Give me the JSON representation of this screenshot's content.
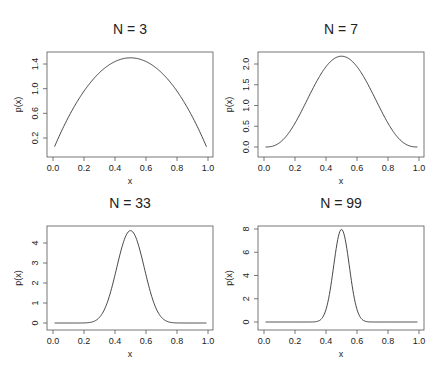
{
  "chart_data": [
    {
      "type": "line",
      "title": "N = 3",
      "xlabel": "x",
      "ylabel": "p(x)",
      "xlim": [
        0.0,
        1.0
      ],
      "ylim": [
        0.06,
        1.5
      ],
      "xticks": [
        "0.0",
        "0.2",
        "0.4",
        "0.6",
        "0.8",
        "1.0"
      ],
      "yticks": [
        "0.2",
        "0.6",
        "1.0",
        "1.4"
      ],
      "ytick_values": [
        0.2,
        0.6,
        1.0,
        1.4
      ],
      "distribution": "Beta(2,2)",
      "alpha": 2,
      "x": [
        0.01,
        0.1,
        0.2,
        0.3,
        0.4,
        0.5,
        0.6,
        0.7,
        0.8,
        0.9,
        0.99
      ],
      "y": [
        0.06,
        0.54,
        0.96,
        1.26,
        1.44,
        1.5,
        1.44,
        1.26,
        0.96,
        0.54,
        0.06
      ],
      "peak": 1.5
    },
    {
      "type": "line",
      "title": "N = 7",
      "xlabel": "x",
      "ylabel": "p(x)",
      "xlim": [
        0.0,
        1.0
      ],
      "ylim": [
        0.0,
        2.19
      ],
      "xticks": [
        "0.0",
        "0.2",
        "0.4",
        "0.6",
        "0.8",
        "1.0"
      ],
      "yticks": [
        "0.0",
        "0.5",
        "1.0",
        "1.5",
        "2.0"
      ],
      "ytick_values": [
        0.0,
        0.5,
        1.0,
        1.5,
        2.0
      ],
      "distribution": "Beta(4,4)",
      "alpha": 4,
      "x": [
        0.01,
        0.1,
        0.2,
        0.3,
        0.4,
        0.5,
        0.6,
        0.7,
        0.8,
        0.9,
        0.99
      ],
      "y": [
        0.0,
        0.1,
        0.72,
        1.52,
        2.07,
        2.19,
        2.07,
        1.52,
        0.72,
        0.1,
        0.0
      ],
      "peak": 2.19
    },
    {
      "type": "line",
      "title": "N = 33",
      "xlabel": "x",
      "ylabel": "p(x)",
      "xlim": [
        0.0,
        1.0
      ],
      "ylim": [
        0.0,
        4.6
      ],
      "xticks": [
        "0.0",
        "0.2",
        "0.4",
        "0.6",
        "0.8",
        "1.0"
      ],
      "yticks": [
        "0",
        "1",
        "2",
        "3",
        "4"
      ],
      "ytick_values": [
        0,
        1,
        2,
        3,
        4
      ],
      "distribution": "Beta(17,17)",
      "alpha": 17,
      "x": [
        0.01,
        0.2,
        0.3,
        0.4,
        0.5,
        0.6,
        0.7,
        0.8,
        0.99
      ],
      "y": [
        0.0,
        0.02,
        0.45,
        2.93,
        4.6,
        2.93,
        0.45,
        0.02,
        0.0
      ],
      "peak": 4.6
    },
    {
      "type": "line",
      "title": "N = 99",
      "xlabel": "x",
      "ylabel": "p(x)",
      "xlim": [
        0.0,
        1.0
      ],
      "ylim": [
        0.0,
        7.96
      ],
      "xticks": [
        "0.0",
        "0.2",
        "0.4",
        "0.6",
        "0.8",
        "1.0"
      ],
      "yticks": [
        "0",
        "2",
        "4",
        "6",
        "8"
      ],
      "ytick_values": [
        0,
        2,
        4,
        6,
        8
      ],
      "distribution": "Beta(50,50)",
      "alpha": 50,
      "x": [
        0.01,
        0.3,
        0.35,
        0.4,
        0.45,
        0.5,
        0.55,
        0.6,
        0.65,
        0.7,
        0.99
      ],
      "y": [
        0.0,
        0.0,
        0.08,
        1.06,
        4.8,
        7.96,
        4.8,
        1.06,
        0.08,
        0.0,
        0.0
      ],
      "peak": 7.96
    }
  ],
  "layout": {
    "panels": [
      {
        "box": [
          47,
          52,
          213,
          157
        ],
        "x0px": 53,
        "x1px": 208,
        "yref": [
          0.2,
          138,
          1.4,
          64
        ],
        "title_y": 34
      },
      {
        "box": [
          258,
          52,
          424,
          157
        ],
        "x0px": 264,
        "x1px": 419,
        "yref": [
          0.0,
          147,
          2.0,
          64
        ],
        "title_y": 34
      },
      {
        "box": [
          47,
          226,
          213,
          330
        ],
        "x0px": 53,
        "x1px": 208,
        "yref": [
          0,
          323,
          4,
          243
        ],
        "title_y": 208
      },
      {
        "box": [
          258,
          226,
          424,
          330
        ],
        "x0px": 264,
        "x1px": 419,
        "yref": [
          0,
          322,
          8,
          229
        ],
        "title_y": 208
      }
    ]
  }
}
